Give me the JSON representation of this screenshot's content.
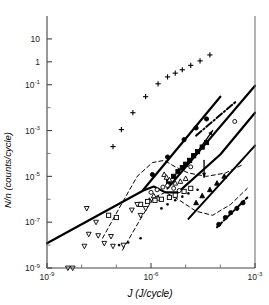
{
  "chart_data": {
    "type": "scatter",
    "title": "",
    "xlabel": "J (J/cycle)",
    "ylabel": "N/n (counts/cycle)",
    "xscale": "log",
    "yscale": "log",
    "xlim": [
      1e-09,
      0.001
    ],
    "ylim": [
      1e-09,
      100.0
    ],
    "grid": false,
    "legend": "none",
    "xticks": [
      {
        "value": 1e-09,
        "label": "10",
        "exp": "-9"
      },
      {
        "value": 1e-06,
        "label": "10",
        "exp": "-6"
      },
      {
        "value": 0.001,
        "label": "10",
        "exp": "-3"
      }
    ],
    "xminor": [
      1e-08,
      1e-07,
      1e-05,
      0.0001
    ],
    "yticks": [
      {
        "value": 10.0,
        "label": "10",
        "exp": ""
      },
      {
        "value": 1.0,
        "label": "1",
        "exp": ""
      },
      {
        "value": 0.1,
        "label": "10",
        "exp": "-1"
      },
      {
        "value": 0.001,
        "label": "10",
        "exp": "-3"
      },
      {
        "value": 1e-05,
        "label": "10",
        "exp": "-5"
      },
      {
        "value": 1e-07,
        "label": "10",
        "exp": "-7"
      },
      {
        "value": 1e-09,
        "label": "10",
        "exp": "-9"
      }
    ],
    "yminor": [
      0.01,
      0.0001,
      1e-06,
      1e-08
    ],
    "series": [
      {
        "name": "plus-markers",
        "marker": "plus",
        "fill": "none",
        "points": [
          [
            8e-08,
            0.0002
          ],
          [
            1.4e-07,
            0.0011
          ],
          [
            3e-07,
            0.006
          ],
          [
            7e-07,
            0.03
          ],
          [
            1.6e-06,
            0.11
          ],
          [
            3e-06,
            0.22
          ],
          [
            5e-06,
            0.32
          ],
          [
            8e-06,
            0.45
          ],
          [
            1.4e-05,
            0.7
          ],
          [
            2.6e-05,
            1.1
          ],
          [
            5e-05,
            2.0
          ]
        ]
      },
      {
        "name": "filled-circles-upper",
        "marker": "circle",
        "fill": "solid",
        "points": [
          [
            1.1e-06,
            1.2e-05
          ],
          [
            3e-06,
            7e-05
          ],
          [
            9e-06,
            0.0004
          ],
          [
            2e-05,
            0.0013
          ],
          [
            4e-05,
            0.0032
          ]
        ]
      },
      {
        "name": "filled-squares",
        "marker": "square",
        "fill": "solid",
        "points": [
          [
            3.2e-06,
            6e-06
          ],
          [
            4.5e-06,
            1e-05
          ],
          [
            6e-06,
            1.6e-05
          ],
          [
            8e-06,
            2.4e-05
          ],
          [
            1e-05,
            3.4e-05
          ],
          [
            1.3e-05,
            5e-05
          ],
          [
            1.7e-05,
            8e-05
          ],
          [
            2.2e-05,
            0.00012
          ],
          [
            3e-05,
            0.00019
          ],
          [
            4e-05,
            0.0003
          ]
        ]
      },
      {
        "name": "open-triangles-up",
        "marker": "triangle-up",
        "fill": "none",
        "points": [
          [
            2.4e-06,
            1.2e-05
          ],
          [
            2.8e-06,
            9e-06
          ],
          [
            3.4e-06,
            7e-06
          ],
          [
            5e-06,
            5e-06
          ],
          [
            7e-06,
            6e-06
          ],
          [
            1e-05,
            8e-06
          ],
          [
            1.2e-06,
            1.4e-06
          ],
          [
            1.6e-06,
            1.1e-06
          ],
          [
            9e-07,
            9e-07
          ]
        ]
      },
      {
        "name": "open-circles",
        "marker": "circle",
        "fill": "none",
        "points": [
          [
            1e-06,
            2e-06
          ],
          [
            1.5e-06,
            2.6e-06
          ],
          [
            2.2e-06,
            3.4e-06
          ],
          [
            3e-06,
            4e-06
          ],
          [
            4.5e-06,
            3e-06
          ],
          [
            6.5e-06,
            2.4e-06
          ],
          [
            0.00026,
            0.0025
          ],
          [
            1.4e-05,
            2.6e-05
          ]
        ]
      },
      {
        "name": "open-squares",
        "marker": "square",
        "fill": "none",
        "points": [
          [
            5e-07,
            6e-07
          ],
          [
            8e-07,
            8e-07
          ],
          [
            1.3e-06,
            9e-07
          ],
          [
            2e-06,
            1e-06
          ],
          [
            3.4e-06,
            1.2e-06
          ],
          [
            5e-06,
            1.5e-06
          ],
          [
            9e-06,
            2.2e-06
          ],
          [
            1.4e-05,
            3e-06
          ],
          [
            6e-08,
            2e-07
          ],
          [
            1e-07,
            1.6e-07
          ]
        ]
      },
      {
        "name": "open-down-triangles",
        "marker": "triangle-down",
        "fill": "none",
        "points": [
          [
            4e-09,
            1e-09
          ],
          [
            5.5e-09,
            1e-09
          ],
          [
            1.2e-08,
            9e-09
          ],
          [
            1.6e-08,
            3e-08
          ],
          [
            2.6e-08,
            1e-07
          ],
          [
            3e-08,
            2.6e-08
          ],
          [
            4.5e-08,
            1.2e-08
          ],
          [
            7e-08,
            2.4e-08
          ],
          [
            8e-08,
            9e-09
          ],
          [
            1.6e-07,
            1e-08
          ],
          [
            1.4e-08,
            4e-07
          ],
          [
            2.8e-07,
            3.4e-07
          ],
          [
            4e-07,
            6e-07
          ],
          [
            7e-07,
            4e-07
          ],
          [
            5e-07,
            2e-07
          ]
        ]
      },
      {
        "name": "filled-triangles-lower",
        "marker": "triangle-up",
        "fill": "solid",
        "points": [
          [
            3e-05,
            1.4e-06
          ],
          [
            5e-05,
            2.6e-06
          ],
          [
            8e-05,
            5e-06
          ],
          [
            0.00013,
            1e-05
          ],
          [
            2e-05,
            7e-07
          ]
        ]
      },
      {
        "name": "filled-circles-lower-right",
        "marker": "circle",
        "fill": "solid",
        "points": [
          [
            9e-05,
            8e-08
          ],
          [
            0.00014,
            1.6e-07
          ],
          [
            0.0002,
            2.6e-07
          ],
          [
            0.0003,
            4e-07
          ],
          [
            0.00045,
            7e-07
          ]
        ]
      },
      {
        "name": "small-dots",
        "marker": "dot",
        "fill": "solid",
        "points": [
          [
            1.2e-07,
            1e-08
          ],
          [
            2.2e-07,
            1.3e-08
          ],
          [
            5e-07,
            2e-08
          ],
          [
            3e-06,
            6e-07
          ],
          [
            5e-06,
            9e-07
          ],
          [
            8e-06,
            1.3e-06
          ],
          [
            2e-06,
            4e-07
          ],
          [
            1.2e-05,
            1.8e-06
          ],
          [
            2.2e-05,
            2.6e-06
          ]
        ]
      }
    ],
    "lines": [
      {
        "name": "main-solid-trend",
        "style": "solid",
        "width": 2.2,
        "points": [
          [
            1e-09,
            1.2e-08
          ],
          [
            6e-07,
            2.4e-06
          ],
          [
            1.2e-06,
            3.6e-06
          ],
          [
            2.6e-06,
            2e-06
          ],
          [
            6e-06,
            2e-06
          ],
          [
            0.0001,
            9e-05
          ],
          [
            0.001,
            0.006
          ]
        ]
      },
      {
        "name": "upper-solid-trend",
        "style": "solid",
        "width": 2.2,
        "points": [
          [
            6e-07,
            2.6e-06
          ],
          [
            0.0001,
            0.03
          ]
        ]
      },
      {
        "name": "mid-solid-trend",
        "style": "solid",
        "width": 2.2,
        "points": [
          [
            3e-06,
            3e-06
          ],
          [
            0.001,
            0.09
          ]
        ]
      },
      {
        "name": "lower-solid-trend",
        "style": "solid",
        "width": 2.0,
        "points": [
          [
            1.2e-05,
            1.4e-07
          ],
          [
            0.001,
            0.00022
          ]
        ]
      },
      {
        "name": "dash-dot-upper",
        "style": "dashdot",
        "width": 2.0,
        "points": [
          [
            2e-05,
            0.0006
          ],
          [
            0.0003,
            0.02
          ]
        ]
      },
      {
        "name": "dash-dot-lower",
        "style": "dashdot",
        "width": 2.0,
        "points": [
          [
            8e-05,
            6e-08
          ],
          [
            0.0006,
            1.2e-06
          ]
        ]
      },
      {
        "name": "envelope-dashed-upper",
        "style": "dashed",
        "width": 1.0,
        "points": [
          [
            4e-08,
            2e-08
          ],
          [
            1.2e-07,
            4e-07
          ],
          [
            4e-07,
            1e-05
          ],
          [
            1.1e-06,
            4e-05
          ],
          [
            2.4e-06,
            5e-05
          ],
          [
            5e-06,
            2.6e-05
          ],
          [
            1.2e-05,
            1.4e-05
          ],
          [
            4e-05,
            1e-05
          ],
          [
            0.00014,
            1.4e-05
          ],
          [
            0.0004,
            3e-05
          ]
        ]
      },
      {
        "name": "envelope-dashed-lower",
        "style": "dashed",
        "width": 1.0,
        "points": [
          [
            1.5e-07,
            6e-09
          ],
          [
            5e-07,
            1.4e-07
          ],
          [
            1.2e-06,
            1.2e-06
          ],
          [
            2.6e-06,
            2e-06
          ],
          [
            6e-06,
            1e-06
          ],
          [
            2e-05,
            3e-07
          ],
          [
            6e-05,
            2e-07
          ],
          [
            0.0002,
            6e-07
          ],
          [
            0.0006,
            3e-06
          ]
        ]
      },
      {
        "name": "arrow-upper",
        "style": "arrow",
        "width": 1.4,
        "points": [
          [
            2.2e-05,
            0.00012
          ],
          [
            6e-05,
            0.001
          ]
        ]
      },
      {
        "name": "arrow-lower",
        "style": "arrow-down",
        "width": 1.4,
        "points": [
          [
            3.4e-05,
            5e-05
          ],
          [
            3.4e-05,
            9e-06
          ]
        ]
      }
    ]
  }
}
